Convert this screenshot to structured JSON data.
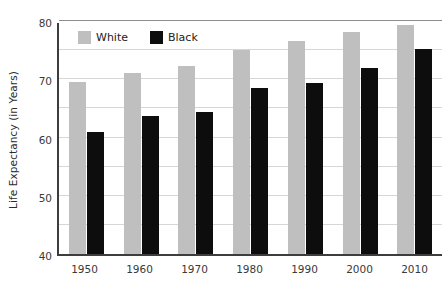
{
  "clipped_header_text": "",
  "chart_data": {
    "type": "bar",
    "title": "",
    "xlabel": "",
    "ylabel": "Life Expectancy (in Years)",
    "ylim": [
      40,
      80
    ],
    "ytick_labels": [
      "40",
      "50",
      "60",
      "70",
      "80"
    ],
    "ytick_values": [
      40,
      50,
      60,
      70,
      80
    ],
    "minor_gridline_values": [
      45,
      50,
      55,
      60,
      65,
      70,
      75
    ],
    "grid": true,
    "legend_position": "upper-left-inside",
    "categories": [
      "1950",
      "1960",
      "1970",
      "1980",
      "1990",
      "2000",
      "2010"
    ],
    "series": [
      {
        "name": "White",
        "color": "#bfbfbf",
        "values": [
          69.5,
          71.0,
          72.3,
          75.1,
          76.6,
          78.2,
          79.4
        ]
      },
      {
        "name": "Black",
        "color": "#0d0d0d",
        "values": [
          61.0,
          63.7,
          64.4,
          68.5,
          69.4,
          72.0,
          75.2
        ]
      }
    ]
  }
}
